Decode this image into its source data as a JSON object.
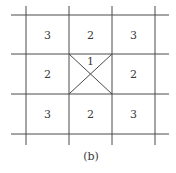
{
  "figure": {
    "caption": "(b)",
    "colors": {
      "line": "#4a4a4a",
      "text": "#3a3a3a",
      "background": "#ffffff"
    },
    "grid": {
      "rows": 3,
      "cols": 3,
      "x_lines": [
        26,
        69,
        112,
        155
      ],
      "y_lines": [
        15,
        54,
        94,
        134
      ],
      "h_extent": [
        11,
        169
      ],
      "v_extent": [
        6,
        145
      ]
    },
    "cells": [
      {
        "row": 0,
        "col": 0,
        "label": "3"
      },
      {
        "row": 0,
        "col": 1,
        "label": "2"
      },
      {
        "row": 0,
        "col": 2,
        "label": "3"
      },
      {
        "row": 1,
        "col": 0,
        "label": "2"
      },
      {
        "row": 1,
        "col": 1,
        "label": "1",
        "crossed": true
      },
      {
        "row": 1,
        "col": 2,
        "label": "2"
      },
      {
        "row": 2,
        "col": 0,
        "label": "3"
      },
      {
        "row": 2,
        "col": 1,
        "label": "2"
      },
      {
        "row": 2,
        "col": 2,
        "label": "3"
      }
    ]
  }
}
